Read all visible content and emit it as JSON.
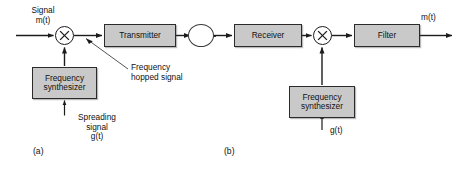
{
  "figure": {
    "panel_a_label": "(a)",
    "panel_b_label": "(b)",
    "block_fill": "#c9c9c9",
    "line_color": "#1c1c1c"
  },
  "transmitter_side": {
    "input_label_line1": "Signal",
    "input_label_line2": "m(t)",
    "mixer": "multiplier-symbol",
    "transmitter_block": "Transmitter",
    "synthesizer_block_line1": "Frequency",
    "synthesizer_block_line2": "synthesizer",
    "spreading_label_line1": "Spreading",
    "spreading_label_line2": "signal",
    "spreading_label_line3": "g(t)",
    "hopped_label_line1": "Frequency",
    "hopped_label_line2": "hopped signal"
  },
  "channel": {
    "symbol": "channel-circle"
  },
  "receiver_side": {
    "receiver_block": "Receiver",
    "mixer": "multiplier-symbol",
    "filter_block": "Filter",
    "output_label": "m(t)",
    "synthesizer_block_line1": "Frequency",
    "synthesizer_block_line2": "synthesizer",
    "despreading_label": "g(t)"
  }
}
